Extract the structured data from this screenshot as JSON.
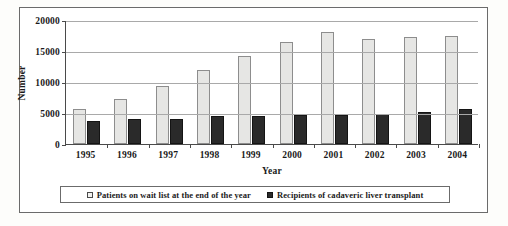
{
  "chart_data": {
    "type": "bar",
    "title": "",
    "xlabel": "Year",
    "ylabel": "Number",
    "ylim": [
      0,
      20000
    ],
    "yticks": [
      0,
      5000,
      10000,
      15000,
      20000
    ],
    "ytick_labels": [
      "0",
      "5000",
      "10000",
      "15000",
      "20000"
    ],
    "grid": true,
    "legend_position": "bottom",
    "categories": [
      "1995",
      "1996",
      "1997",
      "1998",
      "1999",
      "2000",
      "2001",
      "2002",
      "2003",
      "2004"
    ],
    "series": [
      {
        "name": "Patients on wait list at the end of the year",
        "color": "#e6e6e4",
        "values": [
          5600,
          7300,
          9400,
          11900,
          14200,
          16500,
          18100,
          17000,
          17200,
          17500
        ]
      },
      {
        "name": "Recipients of cadaveric liver transplant",
        "color": "#2a2a2a",
        "values": [
          3700,
          4000,
          4000,
          4500,
          4500,
          4600,
          4700,
          4800,
          5100,
          5600
        ]
      }
    ]
  },
  "axes": {
    "y_title": "Number",
    "x_title": "Year",
    "y_ticks": [
      "20000",
      "15000",
      "10000",
      "5000",
      "0"
    ],
    "x_ticks": [
      "1995",
      "1996",
      "1997",
      "1998",
      "1999",
      "2000",
      "2001",
      "2002",
      "2003",
      "2004"
    ]
  },
  "legend": {
    "items": [
      {
        "label": "Patients on wait list at the end of the year",
        "marker": "open-square-marker"
      },
      {
        "label": "Recipients of cadaveric liver transplant",
        "marker": "filled-square-marker"
      }
    ]
  }
}
